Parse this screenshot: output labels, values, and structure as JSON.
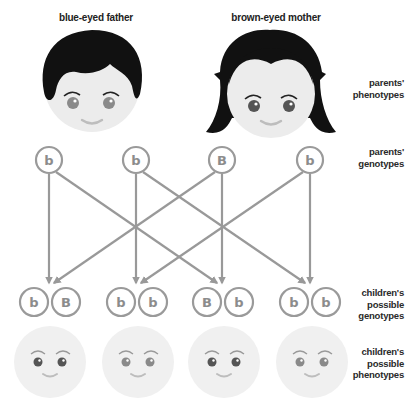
{
  "parents": {
    "father": {
      "title": "blue-eyed father",
      "eye_color": "#8a8a8a",
      "alleles": [
        "b",
        "b"
      ]
    },
    "mother": {
      "title": "brown-eyed mother",
      "eye_color": "#555555",
      "alleles": [
        "B",
        "b"
      ]
    }
  },
  "row_labels": {
    "parents_phenotypes": [
      "parents'",
      "phenotypes"
    ],
    "parents_genotypes": [
      "parents'",
      "genotypes"
    ],
    "children_genotypes": [
      "children's",
      "possible",
      "genotypes"
    ],
    "children_phenotypes": [
      "children's",
      "possible",
      "phenotypes"
    ]
  },
  "parent_alleles": [
    {
      "label": "b",
      "parent": "father"
    },
    {
      "label": "b",
      "parent": "father"
    },
    {
      "label": "B",
      "parent": "mother"
    },
    {
      "label": "b",
      "parent": "mother"
    }
  ],
  "crosses": [
    {
      "from": [
        0,
        2
      ],
      "genotype": [
        "b",
        "B"
      ],
      "phenotype": "brown-eyed"
    },
    {
      "from": [
        1,
        3
      ],
      "genotype": [
        "b",
        "b"
      ],
      "phenotype": "blue-eyed"
    },
    {
      "from": [
        0,
        2
      ],
      "genotype": [
        "B",
        "b"
      ],
      "phenotype": "brown-eyed"
    },
    {
      "from": [
        1,
        3
      ],
      "genotype": [
        "b",
        "b"
      ],
      "phenotype": "blue-eyed"
    }
  ],
  "colors": {
    "allele_stroke": "#9a9a9a",
    "arrow": "#999999",
    "face": "#ececec",
    "child_face": "#f0f0f0",
    "hair": "#111111",
    "brown_eye": "#555555",
    "blue_eye": "#8a8a8a",
    "smile": "#b8b8b8"
  }
}
